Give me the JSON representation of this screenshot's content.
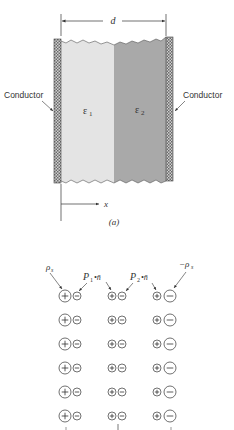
{
  "figure_a": {
    "dimension_label": "d",
    "left_conductor_label": "Conductor",
    "right_conductor_label": "Conductor",
    "dielectric_1_label": "ε",
    "dielectric_1_sub": "1",
    "dielectric_2_label": "ε",
    "dielectric_2_sub": "2",
    "axis_label": "x",
    "caption": "(a)",
    "colors": {
      "dielectric_1": "#e4e4e4",
      "dielectric_2": "#a9a9a9",
      "conductor": "#8a8a8a"
    }
  },
  "figure_b": {
    "left_charge_label": "ρ",
    "left_charge_sub": "s",
    "right_charge_label": "−ρ",
    "right_charge_sub": "s",
    "polarization_1_label": "P",
    "polarization_1_sub": "1",
    "polarization_1_rest": "•n̄",
    "polarization_2_label": "P",
    "polarization_2_sub": "2",
    "polarization_2_rest": "•n̄",
    "rows": 6,
    "columns": [
      {
        "plus_size": "large",
        "minus_size": "small"
      },
      {
        "plus_size": "small",
        "minus_size": "small"
      },
      {
        "plus_size": "small",
        "minus_size": "large"
      }
    ],
    "plus_symbol": "+",
    "minus_symbol": "−"
  }
}
